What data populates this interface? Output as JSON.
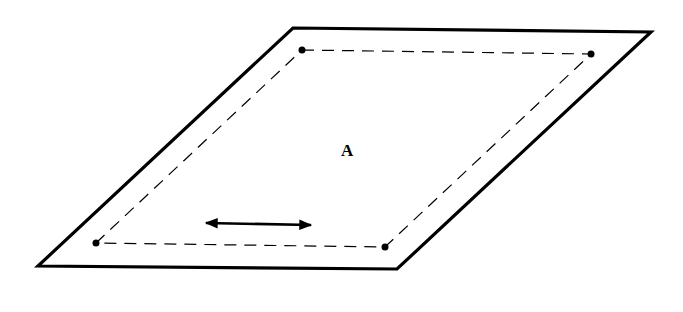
{
  "diagram": {
    "region_label": "A",
    "colors": {
      "stroke": "#000000",
      "background": "#ffffff"
    },
    "outer_parallelogram": {
      "points": [
        [
          293,
          28
        ],
        [
          651,
          32
        ],
        [
          397,
          269
        ],
        [
          38,
          266
        ]
      ],
      "style": "solid"
    },
    "inner_path": {
      "points": [
        [
          302,
          50
        ],
        [
          591,
          54
        ],
        [
          385,
          247
        ],
        [
          96,
          243
        ]
      ],
      "style": "dashed"
    },
    "vertex_dots": [
      [
        302,
        50
      ],
      [
        591,
        54
      ],
      [
        385,
        247
      ],
      [
        96,
        243
      ]
    ],
    "arrow": {
      "type": "double-headed",
      "from": [
        205,
        223
      ],
      "to": [
        312,
        225
      ]
    }
  }
}
